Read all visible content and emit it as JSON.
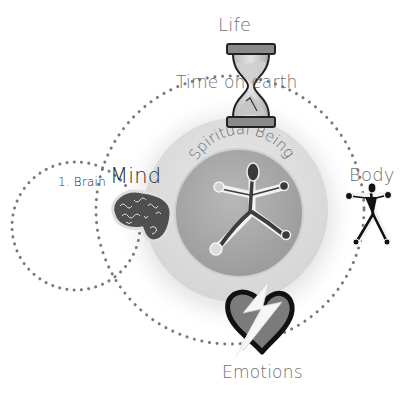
{
  "diagram": {
    "title": "",
    "labels": {
      "life": "Life",
      "time_on_earth": "Time on earth",
      "spiritual_being": "Spiritual Being",
      "body": "Body",
      "brain": "1. Brain",
      "mind": "Mind",
      "emotions": "Emotions"
    },
    "nodes": [
      {
        "id": "life",
        "label": "Life",
        "icon": "hourglass-icon",
        "position": "top"
      },
      {
        "id": "spiritual-being",
        "label": "Spiritual Being",
        "icon": "stick-figure-icon",
        "position": "center"
      },
      {
        "id": "body",
        "label": "Body",
        "icon": "body-figure-icon",
        "position": "right"
      },
      {
        "id": "mind",
        "label": "Mind",
        "icon": "brain-icon",
        "position": "left",
        "sub_label": "1. Brain"
      },
      {
        "id": "emotions",
        "label": "Emotions",
        "icon": "broken-heart-icon",
        "position": "bottom"
      }
    ],
    "colors": {
      "background": "#ffffff",
      "text": "#6f6f6f",
      "dots": "#7a7a7a",
      "inner_disc": "#a9a9a9",
      "glow": "#d9d9d9",
      "figure": "#3a3a3a",
      "heart_fill": "#7a7a7a",
      "heart_outline": "#111111"
    }
  }
}
